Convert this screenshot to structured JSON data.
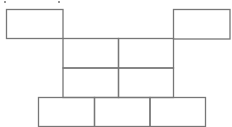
{
  "diagram": {
    "title": "",
    "stroke_color": "#777777",
    "stroke_width": 1.3,
    "background": "#ffffff",
    "clipped_marks": [
      {
        "x": 4,
        "y": 1
      },
      {
        "x": 58,
        "y": 1
      }
    ],
    "shapes": [
      {
        "id": "top-left-box",
        "x": 6.5,
        "y": 9.5,
        "w": 56.5,
        "h": 29,
        "label": ""
      },
      {
        "id": "top-right-box",
        "x": 173.5,
        "y": 9.5,
        "w": 56.5,
        "h": 29.5,
        "label": ""
      },
      {
        "id": "middle-cell-1",
        "x": 63,
        "y": 38.5,
        "w": 55.5,
        "h": 29.5,
        "label": ""
      },
      {
        "id": "middle-cell-2",
        "x": 118.5,
        "y": 38.5,
        "w": 55,
        "h": 29.5,
        "label": ""
      },
      {
        "id": "middle-cell-3",
        "x": 63,
        "y": 68,
        "w": 55.5,
        "h": 29.5,
        "label": ""
      },
      {
        "id": "middle-cell-4",
        "x": 118.5,
        "y": 68,
        "w": 55,
        "h": 29.5,
        "label": ""
      },
      {
        "id": "bottom-cell-1",
        "x": 38.5,
        "y": 97.5,
        "w": 56,
        "h": 29,
        "label": ""
      },
      {
        "id": "bottom-cell-2",
        "x": 94.5,
        "y": 97.5,
        "w": 55.5,
        "h": 29,
        "label": ""
      },
      {
        "id": "bottom-cell-3",
        "x": 150,
        "y": 97.5,
        "w": 55.5,
        "h": 29,
        "label": ""
      }
    ]
  }
}
